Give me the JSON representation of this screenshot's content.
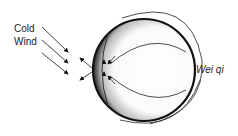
{
  "labels": {
    "cold_line1": "Cold",
    "cold_line2": "Wind",
    "wei_qi": "Wei qi"
  },
  "colors": {
    "stroke": "#111111",
    "text": "#222222"
  }
}
